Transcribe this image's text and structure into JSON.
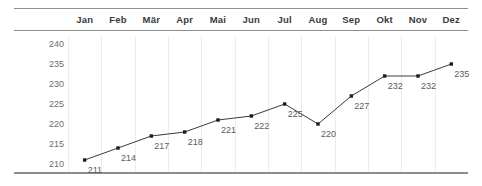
{
  "chart_data": {
    "type": "line",
    "title": "",
    "subtitle": "",
    "xlabel": "",
    "ylabel": "",
    "categories": [
      "Jan",
      "Feb",
      "Mär",
      "Apr",
      "Mai",
      "Jun",
      "Jul",
      "Aug",
      "Sep",
      "Okt",
      "Nov",
      "Dez"
    ],
    "values": [
      211,
      214,
      217,
      218,
      221,
      222,
      225,
      220,
      227,
      232,
      232,
      235
    ],
    "point_labels": [
      "211",
      "214",
      "217",
      "218",
      "221",
      "222",
      "225",
      "220",
      "227",
      "232",
      "232",
      "235"
    ],
    "ylim": [
      208,
      242
    ],
    "yticks": [
      210,
      215,
      220,
      225,
      230,
      235,
      240
    ],
    "ytick_labels": [
      "210",
      "215",
      "220",
      "225",
      "230",
      "235",
      "240"
    ],
    "grid": "vertical",
    "legend": "none",
    "series": [
      {
        "name": "",
        "values": [
          211,
          214,
          217,
          218,
          221,
          222,
          225,
          220,
          227,
          232,
          232,
          235
        ]
      }
    ],
    "colors": {
      "line": "#3a3a3a",
      "marker": "#1c1c1c",
      "gridline": "#ededed",
      "rule": "#8d8d8d",
      "header_text": "#3b3b3b",
      "axis_text": "#6d6d6d",
      "point_label_text": "#5c5c5c",
      "background": "#ffffff"
    }
  }
}
